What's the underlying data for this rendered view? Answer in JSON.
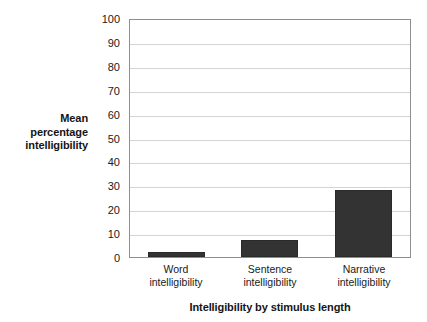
{
  "chart_data": {
    "type": "bar",
    "title": "",
    "categories": [
      "Word intelligibility",
      "Sentence intelligibility",
      "Narrative intelligibility"
    ],
    "category_lines": [
      [
        "Word",
        "intelligibility"
      ],
      [
        "Sentence",
        "intelligibility"
      ],
      [
        "Narrative",
        "intelligibility"
      ]
    ],
    "values": [
      2,
      7,
      28
    ],
    "xlabel": "Intelligibility by stimulus length",
    "ylabel": "Mean percentage intelligibility",
    "ylabel_lines": [
      "Mean",
      "percentage",
      "intelligibility"
    ],
    "ylim": [
      0,
      100
    ],
    "ytick_step": 10,
    "yticks": [
      100,
      90,
      80,
      70,
      60,
      50,
      40,
      30,
      20,
      10,
      0
    ],
    "grid": true,
    "grid_axis": "y",
    "legend": false,
    "legend_position": "none",
    "colors": {
      "bar_fill": "#333333",
      "bar_edge": "#2a2a2a",
      "gridline": "#d4d4d4",
      "axis_border": "#8e8e8e",
      "background": "#ffffff",
      "text": "#1a1a1a"
    }
  }
}
